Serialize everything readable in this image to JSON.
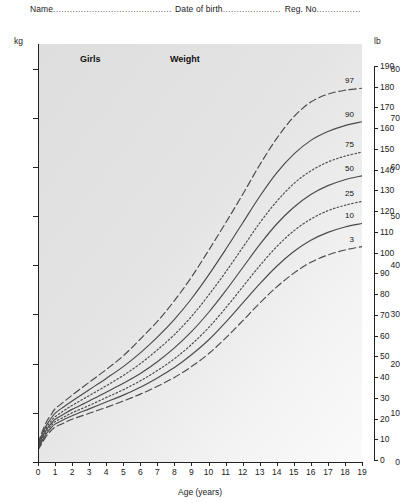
{
  "header": {
    "name_label": "Name",
    "name_dots": "...........................................................",
    "dob_label": "Date of birth",
    "dob_dots": ".....................",
    "reg_label": "Reg. No",
    "reg_dots": "................"
  },
  "chart_data": {
    "type": "line",
    "title": "Weight",
    "subject": "Girls",
    "xlabel": "Age (years)",
    "ylabel": "kg",
    "ylabel_right": "lb",
    "xlim": [
      0,
      19
    ],
    "ylim": [
      0,
      85
    ],
    "ylim_right": [
      0,
      192
    ],
    "grid": false,
    "legend_position": "right-inline",
    "x_ticks": [
      0,
      1,
      2,
      3,
      4,
      5,
      6,
      7,
      8,
      9,
      10,
      11,
      12,
      13,
      14,
      15,
      16,
      17,
      18,
      19
    ],
    "y_ticks_kg": [
      0,
      10,
      20,
      30,
      40,
      50,
      60,
      70,
      80
    ],
    "y_ticks_lb": [
      0,
      10,
      20,
      30,
      40,
      50,
      60,
      70,
      80,
      90,
      100,
      110,
      120,
      130,
      140,
      150,
      160,
      170,
      180,
      190
    ],
    "x": [
      0,
      0.25,
      0.5,
      0.75,
      1,
      1.5,
      2,
      3,
      4,
      5,
      6,
      7,
      8,
      9,
      10,
      11,
      12,
      13,
      14,
      15,
      16,
      17,
      18,
      19
    ],
    "series": [
      {
        "name": "97",
        "label": "97",
        "style": "dashed",
        "values": [
          3.8,
          6.2,
          8.2,
          9.5,
          10.8,
          12.2,
          13.6,
          16.2,
          18.8,
          21.6,
          25.0,
          28.6,
          32.8,
          37.6,
          43.0,
          48.6,
          54.4,
          60.4,
          65.8,
          70.2,
          73.2,
          74.8,
          75.6,
          76.0
        ]
      },
      {
        "name": "90",
        "label": "90",
        "style": "solid",
        "values": [
          3.5,
          5.7,
          7.5,
          8.8,
          9.9,
          11.2,
          12.4,
          14.7,
          17.0,
          19.4,
          22.2,
          25.4,
          29.0,
          33.2,
          38.0,
          43.2,
          48.6,
          54.0,
          58.8,
          62.6,
          65.4,
          67.2,
          68.4,
          69.2
        ]
      },
      {
        "name": "75",
        "label": "75",
        "style": "dotted",
        "values": [
          3.3,
          5.3,
          7.0,
          8.2,
          9.2,
          10.4,
          11.5,
          13.5,
          15.5,
          17.6,
          20.0,
          22.8,
          25.9,
          29.6,
          33.9,
          38.6,
          43.6,
          48.6,
          53.0,
          56.6,
          59.2,
          61.0,
          62.2,
          63.0
        ]
      },
      {
        "name": "50",
        "label": "50",
        "style": "solid",
        "values": [
          3.1,
          5.0,
          6.6,
          7.7,
          8.7,
          9.7,
          10.7,
          12.4,
          14.2,
          16.0,
          18.0,
          20.4,
          23.2,
          26.5,
          30.4,
          34.8,
          39.5,
          44.2,
          48.4,
          51.8,
          54.4,
          56.2,
          57.4,
          58.2
        ]
      },
      {
        "name": "25",
        "label": "25",
        "style": "dotted",
        "values": [
          2.9,
          4.6,
          6.2,
          7.3,
          8.2,
          9.1,
          10.0,
          11.5,
          13.1,
          14.7,
          16.5,
          18.6,
          21.0,
          23.9,
          27.3,
          31.3,
          35.6,
          39.9,
          43.8,
          47.0,
          49.4,
          51.1,
          52.2,
          53.0
        ]
      },
      {
        "name": "10",
        "label": "10",
        "style": "solid",
        "values": [
          2.7,
          4.3,
          5.8,
          6.9,
          7.7,
          8.6,
          9.4,
          10.8,
          12.2,
          13.6,
          15.2,
          17.1,
          19.2,
          21.8,
          24.8,
          28.4,
          32.3,
          36.2,
          39.8,
          42.8,
          45.1,
          46.7,
          47.8,
          48.5
        ]
      },
      {
        "name": "3",
        "label": "3",
        "style": "dashed",
        "values": [
          2.4,
          3.9,
          5.3,
          6.3,
          7.1,
          7.9,
          8.7,
          9.9,
          11.1,
          12.4,
          13.8,
          15.4,
          17.2,
          19.4,
          22.0,
          25.2,
          28.7,
          32.3,
          35.6,
          38.4,
          40.6,
          42.1,
          43.1,
          43.8
        ]
      }
    ]
  }
}
